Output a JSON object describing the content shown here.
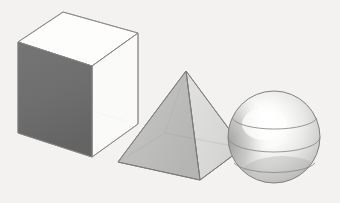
{
  "canvas": {
    "width": 340,
    "height": 203,
    "background_color": "#f3f2f0",
    "description": "Three shaded three-dimensional geometric primitives arranged left to right on a plain off-white background: a transparent wireframe cube, a translucent square pyramid, and a shaded sphere with latitude rings."
  },
  "palette": {
    "background": "#f3f2f0",
    "cube_dark_face": "#6e6e6e",
    "cube_dark_face_shadow": "#636363",
    "cube_light_face": "#fbfbfa",
    "cube_top_face": "#fdfdfc",
    "edge_stroke": "#8a8a8a",
    "edge_stroke_hidden": "#b6b6b6",
    "pyramid_left_face": "#b9b9b7",
    "pyramid_right_face": "#d6d6d4",
    "pyramid_base_face": "#e6e6e4",
    "pyramid_edge": "#7f7f7f",
    "sphere_highlight": "#ffffff",
    "sphere_midtone": "#d8d8d6",
    "sphere_shadow": "#9a9a98",
    "sphere_terminator": "#8c8c8a",
    "sphere_outline": "#818181",
    "sphere_ring": "#8d8d8b"
  },
  "objects": [
    {
      "id": "cube",
      "name": "cube",
      "label": "Cube",
      "shape_type": "hexahedron",
      "faces_visible": 3,
      "shading": "left face dark gray, top and right faces transparent white",
      "bounds": {
        "x": 18,
        "y": 12,
        "width": 122,
        "height": 146
      },
      "vertices": {
        "top_back": [
          63,
          12
        ],
        "top_left": [
          18,
          42
        ],
        "top_right": [
          138,
          33
        ],
        "top_front": [
          92,
          66
        ],
        "bottom_left": [
          18,
          133
        ],
        "bottom_front": [
          92,
          157
        ],
        "bottom_right": [
          138,
          124
        ],
        "bottom_back": [
          63,
          103
        ]
      }
    },
    {
      "id": "pyramid",
      "name": "pyramid",
      "label": "Square Pyramid",
      "shape_type": "square-pyramid",
      "faces_visible": 2,
      "shading": "left face medium gray, right face light gray, hidden base edges faintly visible",
      "bounds": {
        "x": 118,
        "y": 71,
        "width": 125,
        "height": 109
      },
      "vertices": {
        "apex": [
          186,
          71
        ],
        "base_left": [
          118,
          162
        ],
        "base_front": [
          200,
          180
        ],
        "base_right": [
          243,
          148
        ],
        "base_back": [
          165,
          133
        ]
      }
    },
    {
      "id": "sphere",
      "name": "sphere",
      "label": "Sphere",
      "shape_type": "sphere",
      "shading": "bright specular highlight left of center, gradient falloff to gray at rim",
      "latitude_rings": 2,
      "bounds": {
        "x": 228,
        "y": 91,
        "width": 93,
        "height": 93
      },
      "center": [
        274,
        137
      ],
      "radius": 46
    }
  ],
  "chart_data": {
    "type": "scatter",
    "categories": [
      "Cube",
      "Square Pyramid",
      "Sphere"
    ],
    "series": [
      {
        "name": "centroid_x",
        "values": [
          78,
          186,
          274
        ]
      },
      {
        "name": "centroid_y",
        "values": [
          85,
          132,
          137
        ]
      },
      {
        "name": "approx_width",
        "values": [
          122,
          125,
          93
        ]
      },
      {
        "name": "approx_height",
        "values": [
          146,
          109,
          93
        ]
      }
    ],
    "xlabel": "",
    "ylabel": "",
    "grid": false,
    "legend_position": "none"
  }
}
